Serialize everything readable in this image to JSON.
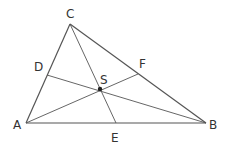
{
  "diagram": {
    "type": "triangle-medians",
    "stroke_color": "#555555",
    "points": {
      "A": {
        "label": "A",
        "x": 26,
        "y": 123
      },
      "B": {
        "label": "B",
        "x": 206,
        "y": 123
      },
      "C": {
        "label": "C",
        "x": 70,
        "y": 24
      },
      "D": {
        "label": "D",
        "x": 47,
        "y": 75
      },
      "E": {
        "label": "E",
        "x": 116,
        "y": 123
      },
      "F": {
        "label": "F",
        "x": 138,
        "y": 74
      },
      "S": {
        "label": "S",
        "x": 100,
        "y": 89
      }
    },
    "segments": [
      [
        "A",
        "B"
      ],
      [
        "B",
        "C"
      ],
      [
        "C",
        "A"
      ],
      [
        "C",
        "E"
      ],
      [
        "A",
        "F"
      ],
      [
        "B",
        "D"
      ]
    ]
  }
}
